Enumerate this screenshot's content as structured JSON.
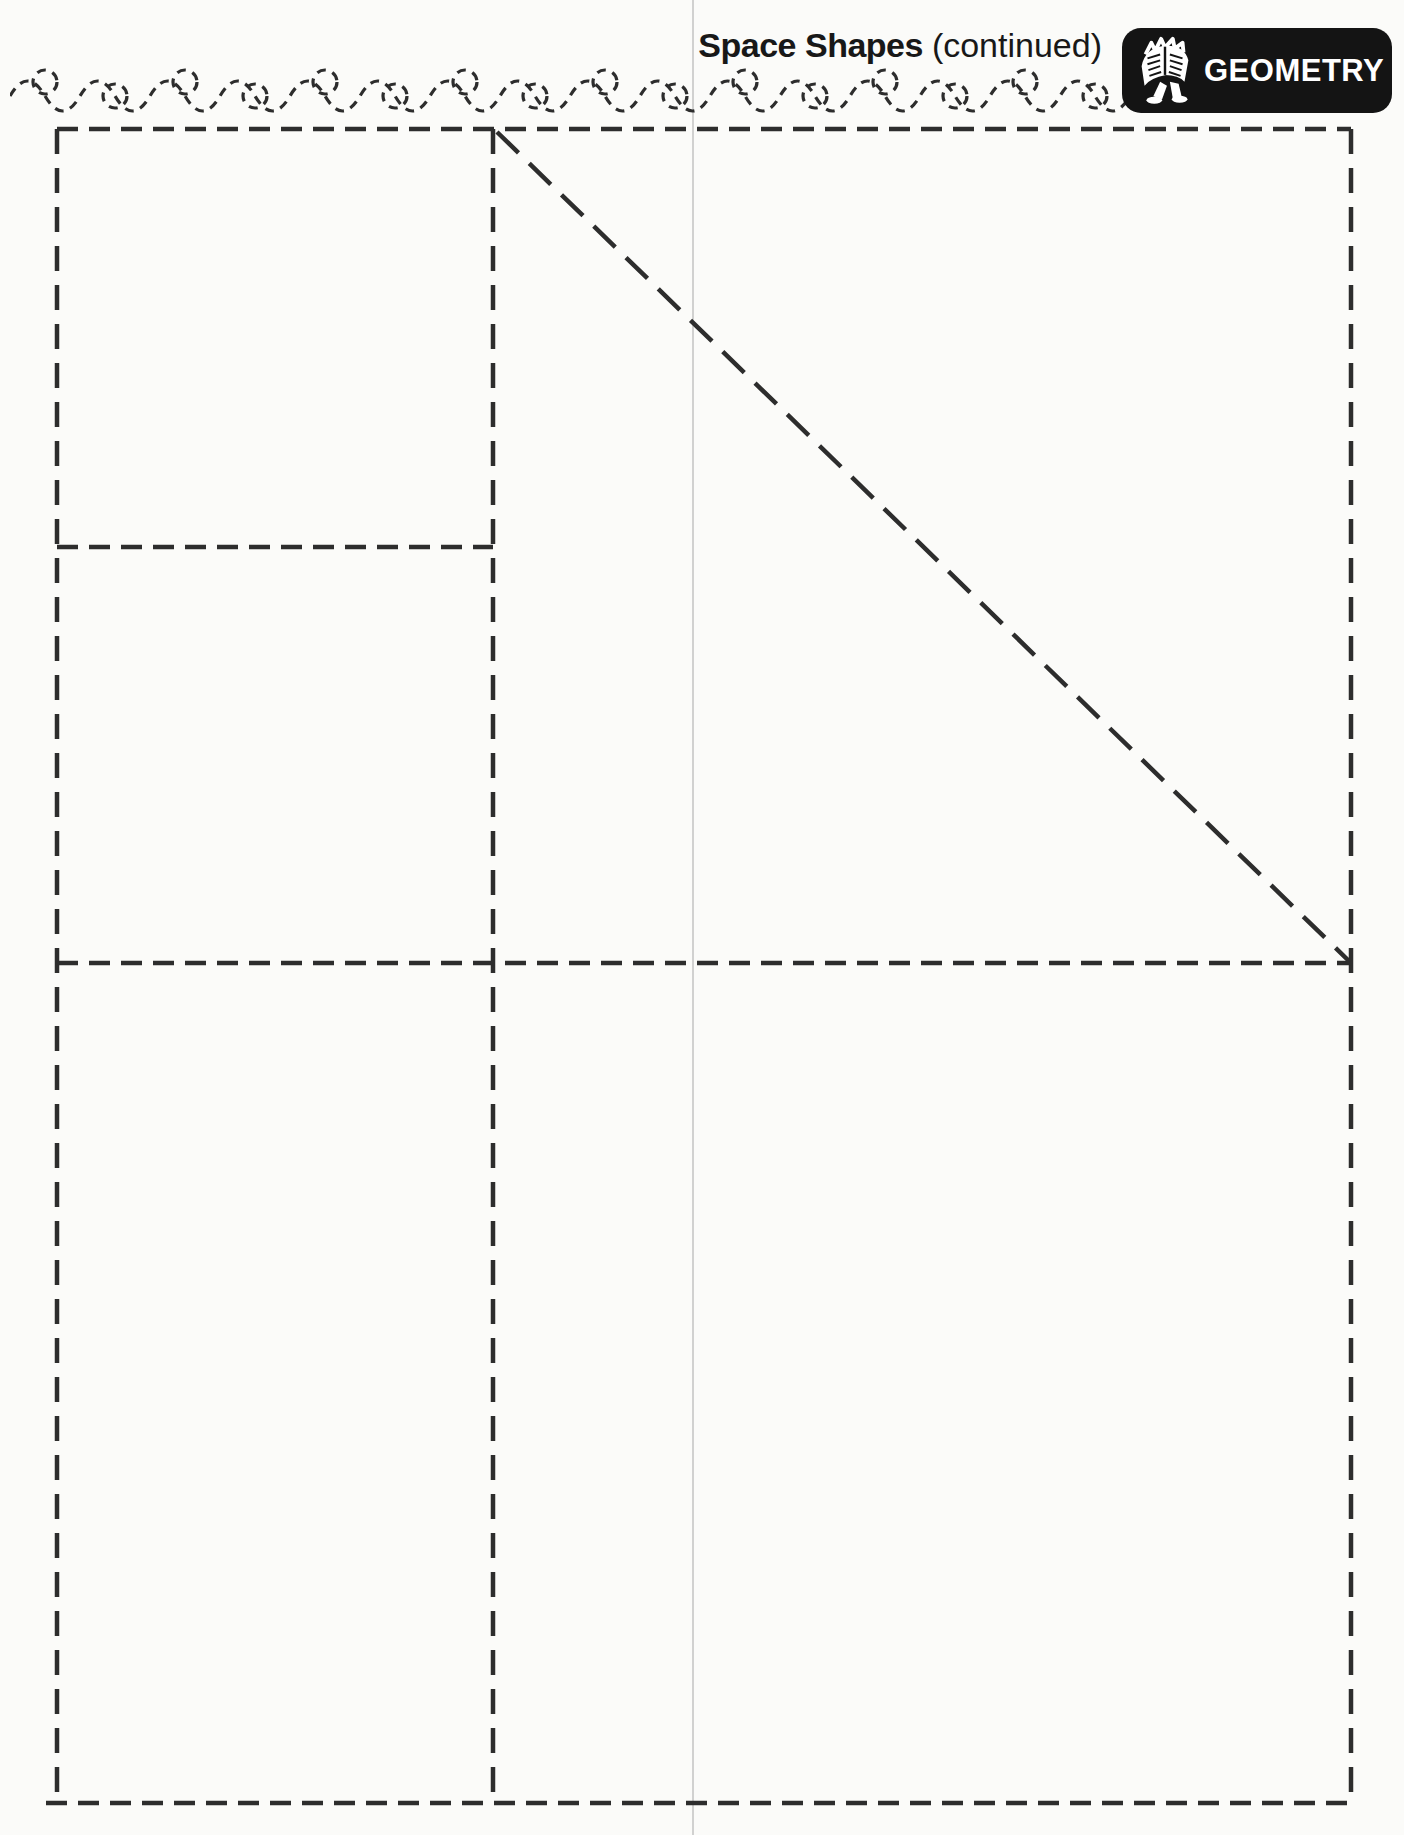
{
  "header": {
    "title": "Space Shapes",
    "subtitle": "(continued)",
    "badge": {
      "label": "GEOMETRY",
      "icon": "walking-open-book-icon"
    }
  },
  "colors": {
    "ink": "#2d2d2d",
    "paper": "#fbfbf9",
    "badge_bg": "#141414",
    "badge_text": "#ffffff",
    "scan_line": "#c9c9c9"
  }
}
